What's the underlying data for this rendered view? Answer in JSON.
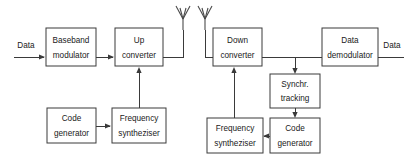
{
  "diagram": {
    "stroke_color": "#3a3a3a",
    "text_color": "#1a1a1a",
    "background_color": "#ffffff",
    "io_labels": {
      "input": "Data",
      "output": "Data"
    },
    "blocks": {
      "baseband_modulator": {
        "line1": "Baseband",
        "line2": "modulator"
      },
      "up_converter": {
        "line1": "Up",
        "line2": "converter"
      },
      "tx_code_generator": {
        "line1": "Code",
        "line2": "generator"
      },
      "tx_frequency_syntheziser": {
        "line1": "Frequency",
        "line2": "syntheziser"
      },
      "down_converter": {
        "line1": "Down",
        "line2": "converter"
      },
      "data_demodulator": {
        "line1": "Data",
        "line2": "demodulator"
      },
      "synchr_tracking": {
        "line1": "Synchr.",
        "line2": "tracking"
      },
      "rx_frequency_syntheziser": {
        "line1": "Frequency",
        "line2": "syntheziser"
      },
      "rx_code_generator": {
        "line1": "Code",
        "line2": "generator"
      }
    },
    "antennas": {
      "transmit": "antenna-icon",
      "receive": "antenna-icon"
    }
  }
}
